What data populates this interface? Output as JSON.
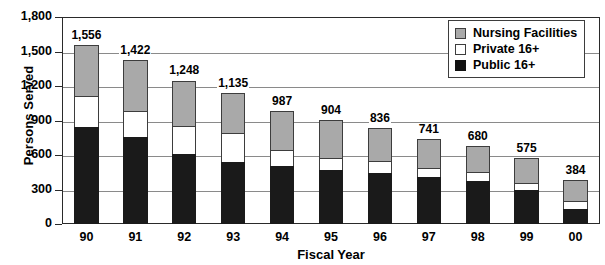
{
  "chart_data": {
    "type": "bar",
    "subtype": "stacked-vertical",
    "title": "",
    "xlabel": "Fiscal Year",
    "ylabel": "Persons Served",
    "categories": [
      "90",
      "91",
      "92",
      "93",
      "94",
      "95",
      "96",
      "97",
      "98",
      "99",
      "00"
    ],
    "series": [
      {
        "name": "Public 16+",
        "color": "#111111",
        "values": [
          845,
          755,
          605,
          540,
          505,
          470,
          440,
          410,
          370,
          295,
          130
        ]
      },
      {
        "name": "Private 16+",
        "color": "#ffffff",
        "values": [
          265,
          225,
          250,
          250,
          135,
          100,
          105,
          80,
          80,
          65,
          70
        ]
      },
      {
        "name": "Nursing Facilities",
        "color": "#a9a9a9",
        "values": [
          446,
          442,
          393,
          345,
          347,
          334,
          291,
          251,
          230,
          215,
          184
        ]
      }
    ],
    "totals": [
      1556,
      1422,
      1248,
      1135,
      987,
      904,
      836,
      741,
      680,
      575,
      384
    ],
    "total_labels": [
      "1,556",
      "1,422",
      "1,248",
      "1,135",
      "987",
      "904",
      "836",
      "741",
      "680",
      "575",
      "384"
    ],
    "ylim": [
      0,
      1800
    ],
    "ytick_values": [
      0,
      300,
      600,
      900,
      1200,
      1500,
      1800
    ],
    "ytick_labels": [
      "0",
      "300",
      "600",
      "900",
      "1,200",
      "1,500",
      "1,800"
    ],
    "grid": true,
    "legend_position": "top-right"
  },
  "legend": {
    "items": [
      {
        "label": "Nursing Facilities",
        "swatch": "nursing-swatch"
      },
      {
        "label": "Private 16+",
        "swatch": "private-swatch"
      },
      {
        "label": "Public 16+",
        "swatch": "public-swatch"
      }
    ]
  },
  "axes": {
    "x_title": "Fiscal Year",
    "y_title": "Persons Served"
  }
}
